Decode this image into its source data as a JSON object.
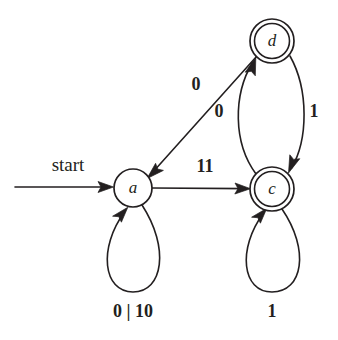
{
  "figure": {
    "kind": "finite-state-machine-diagram",
    "background_color": "#ffffff",
    "ink_color": "#231f20",
    "width": 338,
    "height": 340
  },
  "start": {
    "label": "start",
    "label_x": 68,
    "label_y": 167,
    "line_x1": 15,
    "line_x2": 112,
    "line_y": 187,
    "target_state": "a"
  },
  "states": [
    {
      "id": "a",
      "label": "a",
      "cx": 133,
      "cy": 188,
      "r": 19,
      "accepting": false,
      "start": true
    },
    {
      "id": "c",
      "label": "c",
      "cx": 272,
      "cy": 189,
      "r": 18,
      "r_outer": 22,
      "accepting": true,
      "start": false
    },
    {
      "id": "d",
      "label": "d",
      "cx": 272,
      "cy": 41,
      "r": 18,
      "r_outer": 22,
      "accepting": true,
      "start": false
    }
  ],
  "transitions": [
    {
      "id": "a-self",
      "from": "a",
      "to": "a",
      "label": "0 | 10",
      "label_x": 133,
      "label_y": 313,
      "shape": "self-loop-down"
    },
    {
      "id": "a-to-c",
      "from": "a",
      "to": "c",
      "label": "11",
      "label_x": 205,
      "label_y": 168,
      "shape": "straight-horizontal"
    },
    {
      "id": "d-to-a",
      "from": "d",
      "to": "a",
      "label": "0",
      "label_x": 196,
      "label_y": 86,
      "shape": "straight-diagonal"
    },
    {
      "id": "c-to-d",
      "from": "c",
      "to": "d",
      "label": "0",
      "label_x": 219,
      "label_y": 113,
      "shape": "arc-left"
    },
    {
      "id": "d-to-c",
      "from": "d",
      "to": "c",
      "label": "1",
      "label_x": 314,
      "label_y": 113,
      "shape": "arc-right"
    },
    {
      "id": "c-self",
      "from": "c",
      "to": "c",
      "label": "1",
      "label_x": 272,
      "label_y": 313,
      "shape": "self-loop-down"
    }
  ]
}
